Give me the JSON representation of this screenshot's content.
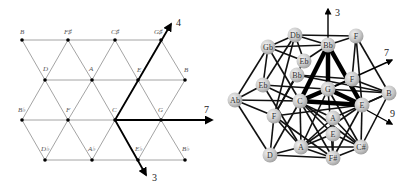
{
  "left_lattice": {
    "title": "Tonnetz lattice",
    "nodes": [
      {
        "label": "B",
        "x": 22,
        "y": 40
      },
      {
        "label": "F♯",
        "x": 68,
        "y": 40
      },
      {
        "label": "C♯",
        "x": 115,
        "y": 40
      },
      {
        "label": "G♯",
        "x": 161,
        "y": 40
      },
      {
        "label": "D",
        "x": 45,
        "y": 80
      },
      {
        "label": "A",
        "x": 92,
        "y": 80
      },
      {
        "label": "E",
        "x": 138,
        "y": 80
      },
      {
        "label": "B",
        "x": 185,
        "y": 80
      },
      {
        "label": "B♭",
        "x": 22,
        "y": 120
      },
      {
        "label": "F",
        "x": 68,
        "y": 120
      },
      {
        "label": "C",
        "x": 115,
        "y": 120
      },
      {
        "label": "G",
        "x": 161,
        "y": 120
      },
      {
        "label": "D♭",
        "x": 45,
        "y": 160
      },
      {
        "label": "A♭",
        "x": 92,
        "y": 160
      },
      {
        "label": "E♭",
        "x": 138,
        "y": 160
      },
      {
        "label": "B♭",
        "x": 185,
        "y": 160
      }
    ],
    "axes": [
      {
        "label": "4",
        "x1": 115,
        "y1": 120,
        "x2": 171,
        "y2": 24,
        "lx": 176,
        "ly": 26
      },
      {
        "label": "7",
        "x1": 115,
        "y1": 120,
        "x2": 212,
        "y2": 120,
        "lx": 204,
        "ly": 110
      },
      {
        "label": "3",
        "x1": 115,
        "y1": 120,
        "x2": 146,
        "y2": 175,
        "lx": 152,
        "ly": 180
      }
    ]
  },
  "right_graph": {
    "title": "3D pitch-class network",
    "nodes": [
      {
        "id": "db",
        "label": "Db",
        "x": 295,
        "y": 35
      },
      {
        "id": "gb",
        "label": "Gb",
        "x": 268,
        "y": 47
      },
      {
        "id": "bb",
        "label": "Bb",
        "x": 328,
        "y": 45
      },
      {
        "id": "f1",
        "label": "F",
        "x": 356,
        "y": 36
      },
      {
        "id": "eb1",
        "label": "Eb",
        "x": 304,
        "y": 61
      },
      {
        "id": "bb2",
        "label": "Bb",
        "x": 297,
        "y": 75
      },
      {
        "id": "eb2",
        "label": "Eb",
        "x": 263,
        "y": 85
      },
      {
        "id": "f2",
        "label": "F",
        "x": 352,
        "y": 79
      },
      {
        "id": "ab",
        "label": "Ab",
        "x": 235,
        "y": 100
      },
      {
        "id": "g",
        "label": "G",
        "x": 328,
        "y": 89
      },
      {
        "id": "b",
        "label": "B",
        "x": 389,
        "y": 93
      },
      {
        "id": "c",
        "label": "C",
        "x": 300,
        "y": 101
      },
      {
        "id": "e1",
        "label": "E",
        "x": 362,
        "y": 105
      },
      {
        "id": "f3",
        "label": "F",
        "x": 274,
        "y": 116
      },
      {
        "id": "a1",
        "label": "A",
        "x": 333,
        "y": 118
      },
      {
        "id": "e2",
        "label": "E",
        "x": 333,
        "y": 134
      },
      {
        "id": "a2",
        "label": "A",
        "x": 301,
        "y": 147
      },
      {
        "id": "cs",
        "label": "C#",
        "x": 361,
        "y": 147
      },
      {
        "id": "d",
        "label": "D",
        "x": 270,
        "y": 155
      },
      {
        "id": "fs",
        "label": "F#",
        "x": 333,
        "y": 158
      }
    ],
    "axes": [
      {
        "label": "3",
        "x1": 328,
        "y1": 89,
        "x2": 328,
        "y2": 9,
        "lx": 335,
        "ly": 14
      },
      {
        "label": "7",
        "x1": 328,
        "y1": 89,
        "x2": 392,
        "y2": 60,
        "lx": 382,
        "ly": 56
      },
      {
        "label": "9",
        "x1": 328,
        "y1": 89,
        "x2": 392,
        "y2": 124,
        "lx": 390,
        "ly": 116
      }
    ]
  }
}
